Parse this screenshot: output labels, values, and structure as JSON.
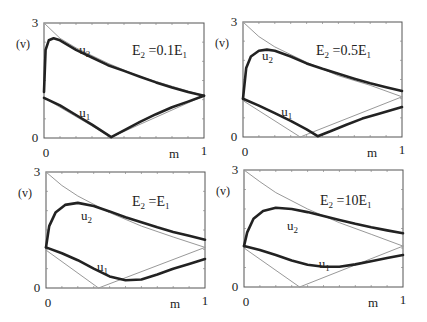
{
  "figure": {
    "ylabel": "(v)",
    "xlabel": "m",
    "y_ticks": [
      "0",
      "3"
    ],
    "x_ticks": [
      "0",
      "1"
    ],
    "curve_labels": [
      "u₂",
      "u₁"
    ]
  },
  "chart_data": [
    {
      "type": "line",
      "title": "E2 = 0.1E1",
      "xlabel": "m",
      "ylabel": "(v)",
      "xlim": [
        0,
        1
      ],
      "ylim": [
        0,
        3
      ],
      "grid": false,
      "legend": "none",
      "annotations": [
        "u2",
        "u1",
        "E2 =0.1E1"
      ],
      "series": [
        {
          "name": "u2",
          "style": "thick",
          "x": [
            0,
            0.01,
            0.03,
            0.06,
            0.1,
            0.2,
            0.3,
            0.4,
            0.5,
            0.6,
            0.7,
            0.8,
            0.9,
            1.0
          ],
          "y": [
            1.2,
            2.3,
            2.55,
            2.6,
            2.55,
            2.3,
            2.1,
            1.9,
            1.75,
            1.6,
            1.45,
            1.32,
            1.2,
            1.1
          ]
        },
        {
          "name": "u1",
          "style": "thick",
          "x": [
            0,
            0.1,
            0.2,
            0.3,
            0.42,
            0.5,
            0.6,
            0.7,
            0.8,
            0.9,
            1.0
          ],
          "y": [
            1.05,
            0.85,
            0.6,
            0.35,
            0.02,
            0.2,
            0.42,
            0.62,
            0.8,
            0.95,
            1.1
          ]
        },
        {
          "name": "reference-upper",
          "style": "thin",
          "x": [
            0,
            0.1,
            0.2,
            0.4,
            0.6,
            0.8,
            1.0
          ],
          "y": [
            3.0,
            2.6,
            2.35,
            1.95,
            1.6,
            1.35,
            1.1
          ]
        },
        {
          "name": "reference-lower",
          "style": "thin",
          "x": [
            0,
            0.42,
            1.0
          ],
          "y": [
            1.05,
            0.02,
            1.1
          ]
        }
      ]
    },
    {
      "type": "line",
      "title": "E2 = 0.5E1",
      "xlabel": "m",
      "ylabel": "(v)",
      "xlim": [
        0,
        1
      ],
      "ylim": [
        0,
        3
      ],
      "grid": false,
      "legend": "none",
      "annotations": [
        "u2",
        "u1",
        "E2 =0.5E1"
      ],
      "series": [
        {
          "name": "u2",
          "style": "thick",
          "x": [
            0,
            0.02,
            0.05,
            0.1,
            0.15,
            0.2,
            0.3,
            0.4,
            0.5,
            0.6,
            0.7,
            0.8,
            0.9,
            1.0
          ],
          "y": [
            1.0,
            1.8,
            2.1,
            2.25,
            2.28,
            2.25,
            2.1,
            1.92,
            1.78,
            1.65,
            1.52,
            1.4,
            1.3,
            1.2
          ]
        },
        {
          "name": "u1",
          "style": "thick",
          "x": [
            0,
            0.1,
            0.2,
            0.3,
            0.4,
            0.47,
            0.55,
            0.65,
            0.75,
            0.85,
            1.0
          ],
          "y": [
            1.0,
            0.82,
            0.62,
            0.42,
            0.2,
            0.02,
            0.15,
            0.32,
            0.48,
            0.6,
            0.78
          ]
        },
        {
          "name": "reference-upper",
          "style": "thin",
          "x": [
            0,
            0.1,
            0.2,
            0.4,
            0.6,
            0.8,
            1.0
          ],
          "y": [
            3.0,
            2.62,
            2.35,
            1.95,
            1.6,
            1.35,
            1.05
          ]
        },
        {
          "name": "reference-lower",
          "style": "thin",
          "x": [
            0,
            0.36,
            1.0
          ],
          "y": [
            0.95,
            0.0,
            1.05
          ]
        }
      ]
    },
    {
      "type": "line",
      "title": "E2 = E1",
      "xlabel": "m",
      "ylabel": "(v)",
      "xlim": [
        0,
        1
      ],
      "ylim": [
        0,
        3
      ],
      "grid": false,
      "legend": "none",
      "annotations": [
        "u2",
        "u1",
        "E2 =E1"
      ],
      "series": [
        {
          "name": "u2",
          "style": "thick",
          "x": [
            0,
            0.02,
            0.06,
            0.12,
            0.2,
            0.3,
            0.4,
            0.5,
            0.6,
            0.7,
            0.8,
            0.9,
            1.0
          ],
          "y": [
            1.05,
            1.6,
            1.95,
            2.15,
            2.2,
            2.12,
            1.98,
            1.83,
            1.7,
            1.57,
            1.45,
            1.35,
            1.25
          ]
        },
        {
          "name": "u1",
          "style": "thick",
          "x": [
            0,
            0.1,
            0.2,
            0.3,
            0.4,
            0.5,
            0.6,
            0.7,
            0.8,
            0.9,
            1.0
          ],
          "y": [
            1.05,
            0.9,
            0.72,
            0.5,
            0.3,
            0.2,
            0.22,
            0.35,
            0.5,
            0.62,
            0.75
          ]
        },
        {
          "name": "reference-upper",
          "style": "thin",
          "x": [
            0,
            0.1,
            0.2,
            0.4,
            0.6,
            0.8,
            1.0
          ],
          "y": [
            3.0,
            2.65,
            2.38,
            1.95,
            1.6,
            1.32,
            1.05
          ]
        },
        {
          "name": "reference-lower",
          "style": "thin",
          "x": [
            0,
            0.33,
            1.0
          ],
          "y": [
            0.98,
            0.0,
            1.05
          ]
        }
      ]
    },
    {
      "type": "line",
      "title": "E2 = 10E1",
      "xlabel": "m",
      "ylabel": "(v)",
      "xlim": [
        0,
        1
      ],
      "ylim": [
        0,
        3
      ],
      "grid": false,
      "legend": "none",
      "annotations": [
        "u2",
        "u1",
        "E2 =10E1"
      ],
      "series": [
        {
          "name": "u2",
          "style": "thick",
          "x": [
            0,
            0.02,
            0.06,
            0.12,
            0.2,
            0.3,
            0.4,
            0.5,
            0.6,
            0.7,
            0.8,
            0.9,
            1.0
          ],
          "y": [
            1.05,
            1.4,
            1.75,
            1.95,
            2.03,
            2.0,
            1.92,
            1.82,
            1.72,
            1.62,
            1.53,
            1.45,
            1.38
          ]
        },
        {
          "name": "u1",
          "style": "thick",
          "x": [
            0,
            0.1,
            0.2,
            0.3,
            0.4,
            0.5,
            0.6,
            0.7,
            0.8,
            0.9,
            1.0
          ],
          "y": [
            1.05,
            0.95,
            0.82,
            0.68,
            0.57,
            0.52,
            0.52,
            0.58,
            0.66,
            0.74,
            0.82
          ]
        },
        {
          "name": "reference-upper",
          "style": "thin",
          "x": [
            0,
            0.1,
            0.2,
            0.4,
            0.6,
            0.8,
            1.0
          ],
          "y": [
            3.0,
            2.7,
            2.42,
            2.0,
            1.65,
            1.35,
            1.05
          ]
        },
        {
          "name": "reference-lower",
          "style": "thin",
          "x": [
            0,
            0.35,
            1.0
          ],
          "y": [
            1.0,
            0.0,
            1.05
          ]
        }
      ]
    }
  ],
  "panels": [
    {
      "title_main": "E",
      "title_sub": "2",
      "title_mid": " =0.1E",
      "title_sub2": "1"
    },
    {
      "title_main": "E",
      "title_sub": "2",
      "title_mid": " =0.5E",
      "title_sub2": "1"
    },
    {
      "title_main": "E",
      "title_sub": "2",
      "title_mid": " =E",
      "title_sub2": "1"
    },
    {
      "title_main": "E",
      "title_sub": "2",
      "title_mid": " =10E",
      "title_sub2": "1"
    }
  ]
}
